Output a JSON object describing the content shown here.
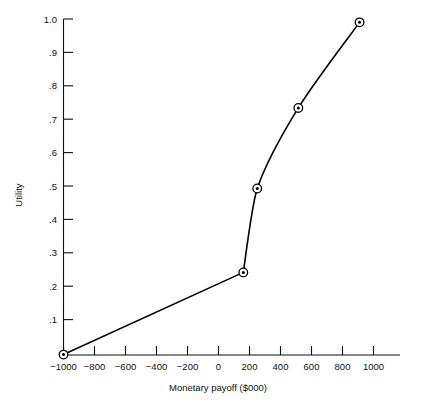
{
  "chart_data": {
    "type": "line",
    "title": "",
    "xlabel": "Monetary payoff ($000)",
    "ylabel": "Utility",
    "xlim": [
      -1100,
      1120
    ],
    "ylim": [
      0,
      1.04
    ],
    "grid": false,
    "legend": "none",
    "marker_style": "circle-with-center-dot",
    "x_ticks": [
      -1000,
      -800,
      -600,
      -400,
      -200,
      0,
      200,
      400,
      600,
      800,
      1000
    ],
    "x_tick_labels": [
      "−1000",
      "−800",
      "−600",
      "−400",
      "−200",
      "0",
      "200",
      "400",
      "600",
      "800",
      "1000"
    ],
    "y_ticks": [
      0.1,
      0.2,
      0.3,
      0.4,
      0.5,
      0.6,
      0.7,
      0.8,
      0.9,
      1.0
    ],
    "y_tick_labels": [
      ".1",
      ".2",
      ".3",
      ".4",
      ".5",
      ".6",
      ".7",
      ".8",
      ".9",
      "1.0"
    ],
    "series": [
      {
        "name": "utility function",
        "x": [
          -1000,
          160,
          250,
          515,
          910
        ],
        "y": [
          0.0,
          0.245,
          0.495,
          0.735,
          0.99
        ],
        "curve": "smooth-after-kink",
        "kink_index": 1
      }
    ]
  },
  "colors": {
    "line": "#000000",
    "axis": "#111111",
    "background": "#ffffff",
    "marker_fill": "#ffffff"
  }
}
